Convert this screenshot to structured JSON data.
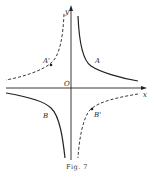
{
  "figure": {
    "caption": "Fig. 7",
    "axes": {
      "x_label": "x",
      "y_label": "y",
      "origin_label": "O"
    },
    "points": {
      "A": "A",
      "A_prime": "A'",
      "B": "B",
      "B_prime": "B'"
    },
    "colors": {
      "stroke": "#222222",
      "background": "#ffffff"
    }
  }
}
